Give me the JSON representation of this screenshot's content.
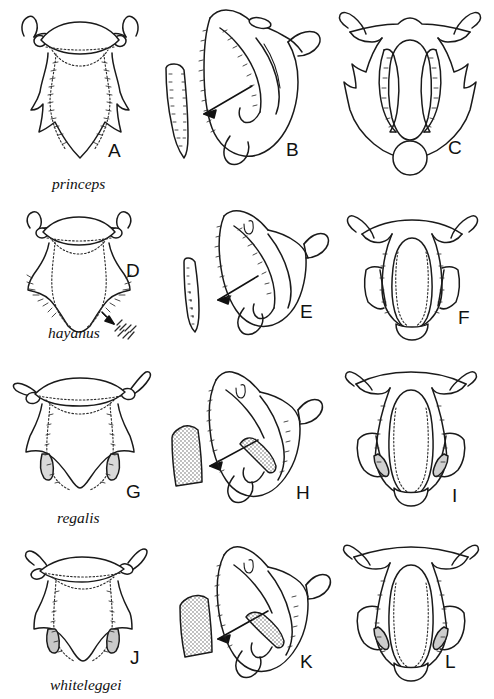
{
  "figure": {
    "type": "scientific-illustration-plate",
    "columns": [
      "dorsal plate view",
      "lateral view with enlarged paramere inset",
      "ventral view"
    ],
    "rows": 4,
    "panel_count": 12,
    "ink_color": "#1a1a1a",
    "background_color": "#ffffff"
  },
  "rows": [
    {
      "species": "princeps",
      "species_label_x": 52,
      "species_label_y": 176,
      "panels": [
        {
          "letter": "A",
          "view": "dorsal",
          "label_x": 108,
          "label_y": 153
        },
        {
          "letter": "B",
          "view": "lateral-with-paramere-inset",
          "label_x": 286,
          "label_y": 152
        },
        {
          "letter": "C",
          "view": "ventral",
          "label_x": 448,
          "label_y": 150
        }
      ],
      "features": {
        "paramere_shading": "unshaded",
        "arrow": true,
        "setae_tuft_callout": false,
        "ventral_basal_circle": true
      }
    },
    {
      "species": "hayanus",
      "species_label_x": 48,
      "species_label_y": 327,
      "panels": [
        {
          "letter": "D",
          "view": "dorsal",
          "label_x": 126,
          "label_y": 272
        },
        {
          "letter": "E",
          "view": "lateral-with-paramere-inset",
          "label_x": 300,
          "label_y": 313
        },
        {
          "letter": "F",
          "view": "ventral",
          "label_x": 458,
          "label_y": 318
        }
      ],
      "features": {
        "paramere_shading": "unshaded",
        "arrow": true,
        "setae_tuft_callout": true,
        "ventral_basal_circle": false
      }
    },
    {
      "species": "regalis",
      "species_label_x": 57,
      "species_label_y": 515,
      "panels": [
        {
          "letter": "G",
          "view": "dorsal",
          "label_x": 126,
          "label_y": 488
        },
        {
          "letter": "H",
          "view": "lateral-with-paramere-inset",
          "label_x": 296,
          "label_y": 489
        },
        {
          "letter": "I",
          "view": "ventral",
          "label_x": 452,
          "label_y": 492
        }
      ],
      "features": {
        "paramere_shading": "stippled",
        "arrow": true,
        "setae_tuft_callout": false,
        "ventral_basal_circle": false
      }
    },
    {
      "species": "whiteleggei",
      "species_label_x": 50,
      "species_label_y": 680,
      "panels": [
        {
          "letter": "J",
          "view": "dorsal",
          "label_x": 130,
          "label_y": 651
        },
        {
          "letter": "K",
          "view": "lateral-with-paramere-inset",
          "label_x": 300,
          "label_y": 655
        },
        {
          "letter": "L",
          "view": "ventral",
          "label_x": 445,
          "label_y": 655
        }
      ],
      "features": {
        "paramere_shading": "stippled",
        "arrow": true,
        "setae_tuft_callout": false,
        "ventral_basal_circle": false
      }
    }
  ]
}
